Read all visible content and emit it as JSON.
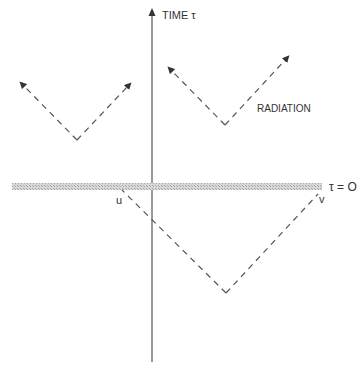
{
  "diagram": {
    "axis_label": "TIME τ",
    "boundary_label": "τ = O",
    "radiation_label": "RADIATION",
    "point_u": "u",
    "point_v": "v"
  },
  "colors": {
    "line": "#555555",
    "band": "#bbbbbb",
    "text": "#333333"
  }
}
